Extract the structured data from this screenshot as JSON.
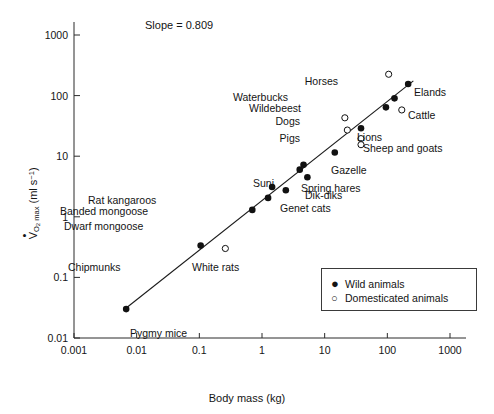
{
  "chart_data": {
    "type": "scatter",
    "title": "",
    "annotation": "Slope = 0.809",
    "xlabel": "Body mass (kg)",
    "ylabel": "VO2 max (ml s-1)",
    "xscale": "log",
    "yscale": "log",
    "xlim": [
      0.001,
      1000
    ],
    "ylim": [
      0.01,
      1000
    ],
    "xticks": [
      "0.001",
      "0.01",
      "0.1",
      "1",
      "10",
      "100",
      "1000"
    ],
    "yticks": [
      "0.01",
      "0.1",
      "1",
      "10",
      "100",
      "1000"
    ],
    "grid": false,
    "legend_position": "lower-right",
    "fit_line": {
      "slope": 0.809,
      "x_start": 0.0062,
      "y_start": 0.029,
      "x_end": 260,
      "y_end": 175
    },
    "series": [
      {
        "name": "Wild animals",
        "marker": "filled-circle",
        "color": "#111111",
        "points": [
          {
            "label": "Pygmy mice",
            "x": 0.0068,
            "y": 0.03,
            "lx": 130,
            "ly": 328,
            "align": "left"
          },
          {
            "label": "Chipmunks",
            "x": 0.105,
            "y": 0.335,
            "lx": 68,
            "ly": 262,
            "align": "left"
          },
          {
            "label": "Dwarf mongoose",
            "x": 0.7,
            "y": 1.3,
            "lx": 64,
            "ly": 221,
            "align": "left"
          },
          {
            "label": "Banded mongoose",
            "x": 1.25,
            "y": 2.05,
            "lx": 60,
            "ly": 206,
            "align": "left"
          },
          {
            "label": "Rat kangaroos",
            "x": 1.45,
            "y": 3.1,
            "lx": 88,
            "ly": 195,
            "align": "left"
          },
          {
            "label": "Genet cats",
            "x": 2.4,
            "y": 2.75,
            "lx": 280,
            "ly": 203,
            "align": "left"
          },
          {
            "label": "Suni",
            "x": 4.0,
            "y": 6.0,
            "lx": 253,
            "ly": 178,
            "align": "left"
          },
          {
            "label": "Spring hares",
            "x": 4.6,
            "y": 7.2,
            "lx": 301,
            "ly": 183,
            "align": "left"
          },
          {
            "label": "Dik-diks",
            "x": 5.3,
            "y": 4.5,
            "lx": 305,
            "ly": 190,
            "align": "left"
          },
          {
            "label": "Gazelle",
            "x": 14.5,
            "y": 11.5,
            "lx": 331,
            "ly": 165,
            "align": "left"
          },
          {
            "label": "Lions",
            "x": 38,
            "y": 29,
            "lx": 357,
            "ly": 132,
            "align": "left"
          },
          {
            "label": "Wildebeest",
            "x": 95,
            "y": 64,
            "lx": 301,
            "ly": 103,
            "align": "right"
          },
          {
            "label": "Waterbucks",
            "x": 130,
            "y": 90,
            "lx": 288,
            "ly": 92,
            "align": "right"
          },
          {
            "label": "Elands",
            "x": 215,
            "y": 155,
            "lx": 414,
            "ly": 87,
            "align": "left"
          }
        ]
      },
      {
        "name": "Domesticated animals",
        "marker": "open-circle",
        "color": "#111111",
        "points": [
          {
            "label": "White rats",
            "x": 0.26,
            "y": 0.3,
            "lx": 192,
            "ly": 262,
            "align": "left"
          },
          {
            "label": "Pigs",
            "x": 23,
            "y": 27,
            "lx": 300,
            "ly": 133,
            "align": "right"
          },
          {
            "label": "Sheep and goats",
            "x": 38,
            "y": 19.5,
            "lx": 363,
            "ly": 143,
            "align": "left"
          },
          {
            "label": "Sheep and goats",
            "x": 38,
            "y": 15.5,
            "lx": null,
            "ly": null,
            "align": "left"
          },
          {
            "label": "Dogs",
            "x": 21,
            "y": 43,
            "lx": 300,
            "ly": 116,
            "align": "right"
          },
          {
            "label": "Cattle",
            "x": 170,
            "y": 58,
            "lx": 408,
            "ly": 110,
            "align": "left"
          },
          {
            "label": "Horses",
            "x": 105,
            "y": 225,
            "lx": 338,
            "ly": 76,
            "align": "right"
          }
        ]
      }
    ],
    "legend": [
      {
        "label": "Wild animals",
        "marker": "filled-circle"
      },
      {
        "label": "Domesticated animals",
        "marker": "open-circle"
      }
    ]
  }
}
